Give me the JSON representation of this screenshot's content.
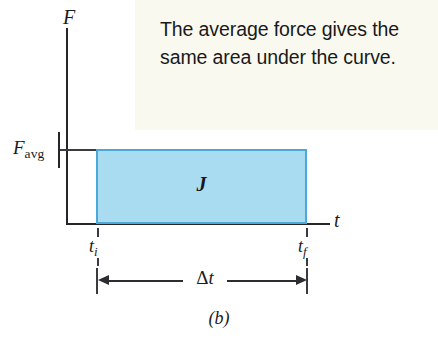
{
  "figure": {
    "caption": "(b)",
    "callout_text": "The average force gives the same area under the curve.",
    "callout_bg": "#f9f9f0"
  },
  "chart_data": {
    "type": "area",
    "title": "",
    "subtitle": "",
    "xlabel": "t",
    "ylabel": "F",
    "grid": false,
    "legend_position": "none",
    "annotations": [
      {
        "name": "impulse-region-label",
        "text": "J",
        "meaning": "impulse (area under force curve)"
      },
      {
        "name": "duration-dimension-label",
        "text": "Δt",
        "meaning": "time interval from t_i to t_f"
      },
      {
        "name": "callout",
        "text": "The average force gives the same area under the curve."
      }
    ],
    "series": [
      {
        "name": "F_avg",
        "type": "constant-force-rectangle",
        "fill": "#a9dcf1",
        "stroke": "#4ba9d9",
        "x": [
          0.22,
          0.91
        ],
        "y": [
          0.0,
          0.0
        ],
        "value": 1.0
      }
    ]
  },
  "axes": {
    "y": {
      "label": "F",
      "label_italic": true,
      "ticks": [
        {
          "name": "F-avg-tick",
          "base": "F",
          "subscript": "avg"
        }
      ]
    },
    "x": {
      "label": "t",
      "label_italic": true,
      "ticks": [
        {
          "name": "t-initial-tick",
          "base": "t",
          "subscript": "i"
        },
        {
          "name": "t-final-tick",
          "base": "t",
          "subscript": "f"
        }
      ]
    }
  },
  "labels": {
    "f_axis": "F",
    "t_axis": "t",
    "favg_base": "F",
    "favg_sub": "avg",
    "t_initial_base": "t",
    "t_initial_sub": "i",
    "t_final_base": "t",
    "t_final_sub": "f",
    "impulse": "J",
    "delta_base": "Δ",
    "delta_var": "t"
  },
  "colors": {
    "rect_fill": "#a9dcf1",
    "rect_stroke": "#4ba9d9",
    "ink": "#26262a",
    "callout_bg": "#f9f9f0",
    "page_bg": "#ffffff"
  }
}
